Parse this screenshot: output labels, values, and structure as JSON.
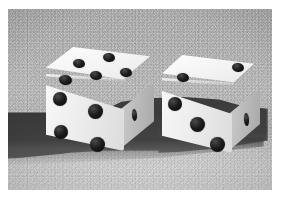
{
  "photo": {
    "subject": "two six-sided dice",
    "color_mode": "black-and-white",
    "frame_color": "#ffffff",
    "surface_color": "#b6b6b6",
    "shadow_color": "#3c3c3c",
    "die_body_color": "#f4f4f4",
    "pip_color": "#111111",
    "alt_text": "Black and white photograph of two white dice resting on a textured gray surface, casting a dark shadow to the left."
  },
  "dice": [
    {
      "id": "left-die",
      "label": "left die",
      "total_visible": 10,
      "faces": [
        {
          "name": "top",
          "value": 5,
          "pattern": "quincunx",
          "pips": [
            {
              "x": 27,
              "y": 12,
              "w": 12,
              "h": 9
            },
            {
              "x": 57,
              "y": 6,
              "w": 12,
              "h": 9
            },
            {
              "x": 44,
              "y": 24,
              "w": 12,
              "h": 9
            },
            {
              "x": 13,
              "y": 28,
              "w": 13,
              "h": 10
            },
            {
              "x": 74,
              "y": 21,
              "w": 12,
              "h": 9
            }
          ]
        },
        {
          "name": "front",
          "value": 4,
          "pattern": "square",
          "pips": [
            {
              "x": 7,
              "y": 45,
              "w": 14,
              "h": 14
            },
            {
              "x": 42,
              "y": 57,
              "w": 15,
              "h": 15
            },
            {
              "x": 8,
              "y": 78,
              "w": 14,
              "h": 14
            },
            {
              "x": 44,
              "y": 90,
              "w": 15,
              "h": 15
            }
          ]
        },
        {
          "name": "right",
          "value": 1,
          "pattern": "center",
          "pips": [
            {
              "x": 86,
              "y": 62,
              "w": 5,
              "h": 12
            }
          ]
        }
      ]
    },
    {
      "id": "right-die",
      "label": "right die",
      "total_visible": 6,
      "faces": [
        {
          "name": "top",
          "value": 2,
          "pattern": "diagonal",
          "pips": [
            {
              "x": 17,
              "y": 18,
              "w": 12,
              "h": 9
            },
            {
              "x": 72,
              "y": 8,
              "w": 12,
              "h": 9
            }
          ]
        },
        {
          "name": "front",
          "value": 3,
          "pattern": "diagonal",
          "pips": [
            {
              "x": 8,
              "y": 42,
              "w": 14,
              "h": 14
            },
            {
              "x": 30,
              "y": 62,
              "w": 15,
              "h": 15
            },
            {
              "x": 50,
              "y": 82,
              "w": 15,
              "h": 15
            }
          ]
        },
        {
          "name": "right",
          "value": 1,
          "pattern": "center",
          "pips": [
            {
              "x": 84,
              "y": 58,
              "w": 5,
              "h": 13
            }
          ]
        }
      ]
    }
  ]
}
